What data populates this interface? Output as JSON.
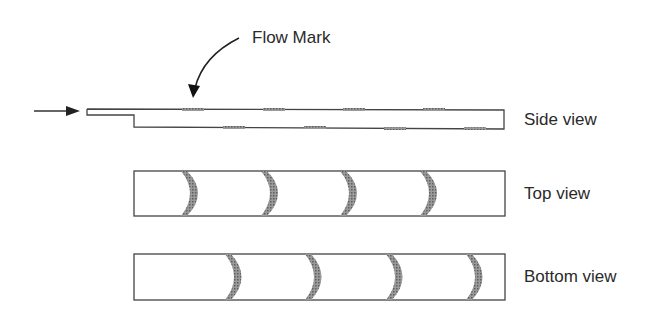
{
  "diagram": {
    "annotation": "Flow Mark",
    "views": [
      {
        "id": "side",
        "label": "Side view"
      },
      {
        "id": "top",
        "label": "Top view"
      },
      {
        "id": "bottom",
        "label": "Bottom view"
      }
    ],
    "colors": {
      "line": "#3a3a3a",
      "mark": "#7a7a7a",
      "text": "#2a2a2a"
    }
  }
}
